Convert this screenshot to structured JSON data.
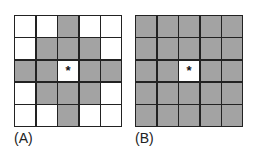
{
  "panels": [
    {
      "label": "(A)",
      "center_marker": "*",
      "cells": [
        [
          0,
          0,
          1,
          0,
          0
        ],
        [
          0,
          1,
          1,
          1,
          0
        ],
        [
          1,
          1,
          2,
          1,
          1
        ],
        [
          0,
          1,
          1,
          1,
          0
        ],
        [
          0,
          0,
          1,
          0,
          0
        ]
      ]
    },
    {
      "label": "(B)",
      "center_marker": "*",
      "cells": [
        [
          1,
          1,
          1,
          1,
          1
        ],
        [
          1,
          1,
          1,
          1,
          1
        ],
        [
          1,
          1,
          2,
          1,
          1
        ],
        [
          1,
          1,
          1,
          1,
          1
        ],
        [
          1,
          1,
          1,
          1,
          1
        ]
      ]
    }
  ],
  "colors": {
    "filled": "#a3a3a3",
    "empty": "#ffffff",
    "grid_line": "#222222"
  },
  "legend": {
    "0": "empty",
    "1": "neighbor (shaded)",
    "2": "center cell (*)"
  }
}
